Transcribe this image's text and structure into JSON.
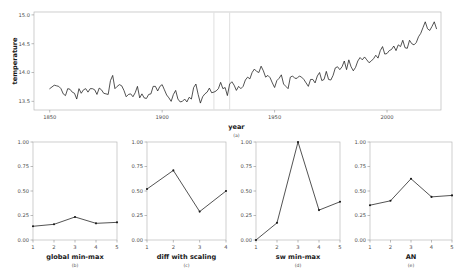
{
  "figure": {
    "panels": [
      "(a)",
      "(b)",
      "(c)",
      "(d)",
      "(e)"
    ]
  },
  "chart_data": [
    {
      "type": "line",
      "panel": "(a)",
      "title": "",
      "xlabel": "year",
      "ylabel": "temperature",
      "xlim": [
        1843,
        2024
      ],
      "ylim": [
        13.35,
        15.05
      ],
      "xticks": [
        1850,
        1900,
        1950,
        2000
      ],
      "xticklabels": [
        "1850",
        "1900",
        "1950",
        "2000"
      ],
      "yticks": [
        13.5,
        14.0,
        14.5,
        15.0
      ],
      "yticklabels": [
        "13.5",
        "14.0",
        "14.5",
        "15.0"
      ],
      "grid": false,
      "legend": "none",
      "annotations": [
        {
          "type": "vline",
          "x": 1923,
          "color": "#e2e2e2"
        },
        {
          "type": "vline",
          "x": 1930,
          "color": "#e2e2e2"
        }
      ],
      "x": [
        1850,
        1851,
        1852,
        1853,
        1854,
        1855,
        1856,
        1857,
        1858,
        1859,
        1860,
        1861,
        1862,
        1863,
        1864,
        1865,
        1866,
        1867,
        1868,
        1869,
        1870,
        1871,
        1872,
        1873,
        1874,
        1875,
        1876,
        1877,
        1878,
        1879,
        1880,
        1881,
        1882,
        1883,
        1884,
        1885,
        1886,
        1887,
        1888,
        1889,
        1890,
        1891,
        1892,
        1893,
        1894,
        1895,
        1896,
        1897,
        1898,
        1899,
        1900,
        1901,
        1902,
        1903,
        1904,
        1905,
        1906,
        1907,
        1908,
        1909,
        1910,
        1911,
        1912,
        1913,
        1914,
        1915,
        1916,
        1917,
        1918,
        1919,
        1920,
        1921,
        1922,
        1923,
        1924,
        1925,
        1926,
        1927,
        1928,
        1929,
        1930,
        1931,
        1932,
        1933,
        1934,
        1935,
        1936,
        1937,
        1938,
        1939,
        1940,
        1941,
        1942,
        1943,
        1944,
        1945,
        1946,
        1947,
        1948,
        1949,
        1950,
        1951,
        1952,
        1953,
        1954,
        1955,
        1956,
        1957,
        1958,
        1959,
        1960,
        1961,
        1962,
        1963,
        1964,
        1965,
        1966,
        1967,
        1968,
        1969,
        1970,
        1971,
        1972,
        1973,
        1974,
        1975,
        1976,
        1977,
        1978,
        1979,
        1980,
        1981,
        1982,
        1983,
        1984,
        1985,
        1986,
        1987,
        1988,
        1989,
        1990,
        1991,
        1992,
        1993,
        1994,
        1995,
        1996,
        1997,
        1998,
        1999,
        2000,
        2001,
        2002,
        2003,
        2004,
        2005,
        2006,
        2007,
        2008,
        2009,
        2010,
        2011,
        2012,
        2013,
        2014,
        2015,
        2016,
        2017,
        2018,
        2019,
        2020,
        2021,
        2022,
        2023
      ],
      "y": [
        13.72,
        13.75,
        13.78,
        13.77,
        13.76,
        13.72,
        13.63,
        13.6,
        13.72,
        13.71,
        13.66,
        13.64,
        13.54,
        13.72,
        13.64,
        13.7,
        13.72,
        13.66,
        13.72,
        13.72,
        13.7,
        13.62,
        13.73,
        13.7,
        13.64,
        13.63,
        13.62,
        13.86,
        13.95,
        13.72,
        13.76,
        13.79,
        13.77,
        13.69,
        13.58,
        13.62,
        13.63,
        13.58,
        13.65,
        13.76,
        13.56,
        13.63,
        13.56,
        13.55,
        13.62,
        13.63,
        13.76,
        13.76,
        13.68,
        13.76,
        13.79,
        13.7,
        13.61,
        13.56,
        13.5,
        13.62,
        13.69,
        13.54,
        13.49,
        13.5,
        13.54,
        13.49,
        13.57,
        13.54,
        13.74,
        13.8,
        13.62,
        13.47,
        13.58,
        13.63,
        13.66,
        13.73,
        13.65,
        13.66,
        13.68,
        13.72,
        13.83,
        13.72,
        13.74,
        13.6,
        13.8,
        13.84,
        13.78,
        13.69,
        13.76,
        13.72,
        13.76,
        13.87,
        13.92,
        13.89,
        14.0,
        14.06,
        14.02,
        14.0,
        14.11,
        14.03,
        13.92,
        13.95,
        13.91,
        13.82,
        13.74,
        13.86,
        13.9,
        13.96,
        13.8,
        13.76,
        13.72,
        13.92,
        13.94,
        13.9,
        13.9,
        13.94,
        13.92,
        13.88,
        13.82,
        13.76,
        13.88,
        13.88,
        13.82,
        13.94,
        14.0,
        13.86,
        13.88,
        14.02,
        13.88,
        13.87,
        13.95,
        14.08,
        14.1,
        14.05,
        14.1,
        14.2,
        14.05,
        14.22,
        14.1,
        14.03,
        14.09,
        14.2,
        14.26,
        14.22,
        14.27,
        14.22,
        14.17,
        14.2,
        14.24,
        14.3,
        14.25,
        14.38,
        14.45,
        14.32,
        14.33,
        14.38,
        14.4,
        14.46,
        14.38,
        14.48,
        14.45,
        14.56,
        14.43,
        14.42,
        14.56,
        14.5,
        14.48,
        14.52,
        14.62,
        14.68,
        14.78,
        14.88,
        14.76,
        14.73,
        14.8,
        14.88,
        14.76
      ]
    },
    {
      "type": "line",
      "panel": "(b)",
      "xlabel": "global min-max",
      "ylabel": "",
      "categories": [
        1,
        2,
        3,
        4,
        5
      ],
      "xticklabels": [
        "1",
        "2",
        "3",
        "4",
        "5"
      ],
      "values": [
        0.14,
        0.16,
        0.235,
        0.17,
        0.18
      ],
      "ylim": [
        0.0,
        1.0
      ],
      "yticks": [
        0.0,
        0.25,
        0.5,
        0.75,
        1.0
      ],
      "yticklabels": [
        "0.00",
        "0.25",
        "0.50",
        "0.75",
        "1.00"
      ],
      "grid": false,
      "legend": "none"
    },
    {
      "type": "line",
      "panel": "(c)",
      "xlabel": "diff with scaling",
      "ylabel": "",
      "categories": [
        1,
        2,
        3,
        4
      ],
      "xticklabels": [
        "1",
        "2",
        "3",
        "4"
      ],
      "values": [
        0.52,
        0.71,
        0.29,
        0.5
      ],
      "ylim": [
        0.0,
        1.0
      ],
      "yticks": [
        0.0,
        0.25,
        0.5,
        0.75,
        1.0
      ],
      "yticklabels": [
        "0.00",
        "0.25",
        "0.50",
        "0.75",
        "1.00"
      ],
      "grid": false,
      "legend": "none"
    },
    {
      "type": "line",
      "panel": "(d)",
      "xlabel": "sw min-max",
      "ylabel": "",
      "categories": [
        1,
        2,
        3,
        4,
        5
      ],
      "xticklabels": [
        "1",
        "2",
        "3",
        "4",
        "5"
      ],
      "values": [
        0.0,
        0.175,
        1.0,
        0.305,
        0.39
      ],
      "ylim": [
        0.0,
        1.0
      ],
      "yticks": [
        0.0,
        0.25,
        0.5,
        0.75,
        1.0
      ],
      "yticklabels": [
        "0.00",
        "0.25",
        "0.50",
        "0.75",
        "1.00"
      ],
      "grid": false,
      "legend": "none"
    },
    {
      "type": "line",
      "panel": "(e)",
      "xlabel": "AN",
      "ylabel": "",
      "categories": [
        1,
        2,
        3,
        4,
        5
      ],
      "xticklabels": [
        "1",
        "2",
        "3",
        "4",
        "5"
      ],
      "values": [
        0.355,
        0.4,
        0.625,
        0.44,
        0.455
      ],
      "ylim": [
        0.0,
        1.0
      ],
      "yticks": [
        0.0,
        0.25,
        0.5,
        0.75,
        1.0
      ],
      "yticklabels": [
        "0.00",
        "0.25",
        "0.50",
        "0.75",
        "1.00"
      ],
      "grid": false,
      "legend": "none"
    }
  ]
}
